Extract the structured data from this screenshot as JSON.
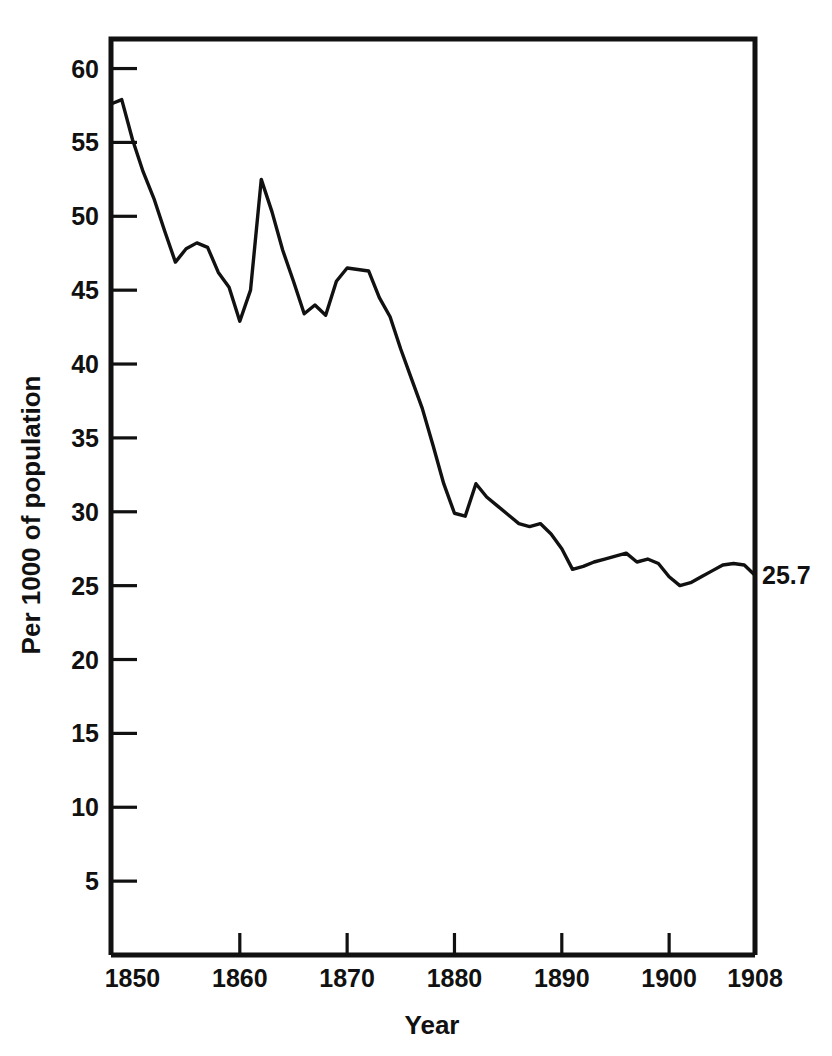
{
  "figure": {
    "clipped_header_text": "",
    "background_color": "#ffffff",
    "ink_color": "#111111"
  },
  "axes": {
    "y_title": "Per 1000 of population",
    "x_title": "Year",
    "y_ticks": [
      5,
      10,
      15,
      20,
      25,
      30,
      35,
      40,
      45,
      50,
      55,
      60
    ],
    "x_ticks": [
      1850,
      1860,
      1870,
      1880,
      1890,
      1900,
      1908
    ]
  },
  "annotations": [
    {
      "name": "end-value-label",
      "text": "25.7",
      "x": 1908,
      "y": 25.7
    }
  ],
  "chart_data": {
    "type": "line",
    "title": "",
    "subtitle": "",
    "xlabel": "Year",
    "ylabel": "Per 1000 of population",
    "xlim": [
      1848,
      1908
    ],
    "ylim": [
      0,
      62
    ],
    "xticks": [
      1850,
      1860,
      1870,
      1880,
      1890,
      1900,
      1908
    ],
    "xticklabels": [
      "1850",
      "1860",
      "1870",
      "1880",
      "1890",
      "1900",
      "1908"
    ],
    "yticks": [
      5,
      10,
      15,
      20,
      25,
      30,
      35,
      40,
      45,
      50,
      55,
      60
    ],
    "yticklabels": [
      "5",
      "10",
      "15",
      "20",
      "25",
      "30",
      "35",
      "40",
      "45",
      "50",
      "55",
      "60"
    ],
    "grid": false,
    "legend": false,
    "legend_position": "none",
    "annotations": [
      {
        "text": "25.7",
        "x": 1908,
        "y": 25.7
      }
    ],
    "series": [
      {
        "name": "Marriage rate per 1000 of population",
        "color": "#111111",
        "x": [
          1848,
          1849,
          1850,
          1851,
          1852,
          1853,
          1854,
          1855,
          1856,
          1857,
          1858,
          1859,
          1860,
          1861,
          1862,
          1863,
          1864,
          1865,
          1866,
          1867,
          1868,
          1869,
          1870,
          1871,
          1872,
          1873,
          1874,
          1875,
          1876,
          1877,
          1878,
          1879,
          1880,
          1881,
          1882,
          1883,
          1884,
          1885,
          1886,
          1887,
          1888,
          1889,
          1890,
          1891,
          1892,
          1893,
          1894,
          1895,
          1896,
          1897,
          1898,
          1899,
          1900,
          1901,
          1902,
          1903,
          1904,
          1905,
          1906,
          1907,
          1908
        ],
        "y": [
          57.6,
          57.9,
          55.2,
          53.0,
          51.2,
          49.0,
          46.9,
          47.8,
          48.2,
          47.9,
          46.2,
          45.2,
          42.9,
          45.0,
          52.5,
          50.3,
          47.7,
          45.6,
          43.4,
          44.0,
          43.3,
          45.6,
          46.5,
          46.4,
          46.3,
          44.5,
          43.2,
          41.0,
          39.0,
          37.0,
          34.5,
          31.9,
          29.9,
          29.7,
          31.9,
          31.0,
          30.4,
          29.8,
          29.2,
          29.0,
          29.2,
          28.5,
          27.5,
          26.1,
          26.3,
          26.6,
          26.8,
          27.0,
          27.2,
          26.6,
          26.8,
          26.5,
          25.6,
          25.0,
          25.2,
          25.6,
          26.0,
          26.4,
          26.5,
          26.4,
          25.7
        ]
      }
    ]
  }
}
